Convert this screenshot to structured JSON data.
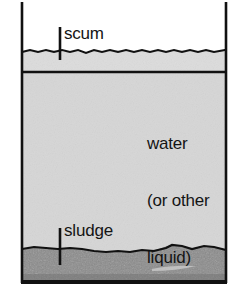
{
  "figure": {
    "type": "diagram",
    "width": 242,
    "height": 301
  },
  "colors": {
    "background": "#ffffff",
    "outline": "#111111",
    "scum_fill": "#dcdcdc",
    "water_fill": "#d6d6d6",
    "sludge_fill": "#8a8a8a",
    "sludge_dark": "#6f6f6f",
    "text": "#141414"
  },
  "labels": {
    "scum": "scum",
    "sludge": "sludge",
    "water_line1": "water",
    "water_line2": "(or other",
    "water_line3": "liquid)"
  },
  "tank": {
    "left_wall_x": 22,
    "right_wall_x": 225,
    "top_y": 2,
    "bottom_y": 283,
    "scum_top_y": 51,
    "scum_bottom_y": 72,
    "sludge_top_y": 248
  },
  "pointers": {
    "scum_tick_x": 60,
    "scum_tick_top_y": 27,
    "scum_tick_bottom_y": 60,
    "sludge_tick_x": 60,
    "sludge_tick_top_y": 228,
    "sludge_tick_bottom_y": 264
  }
}
